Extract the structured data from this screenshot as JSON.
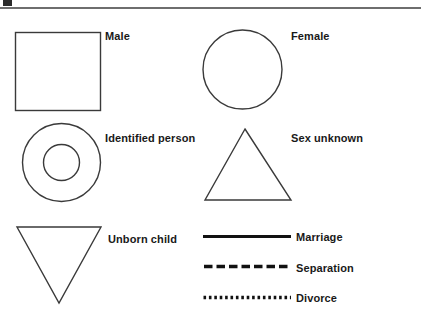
{
  "page": {
    "background_color": "#ffffff",
    "stroke_color": "#3a3a3a",
    "text_color": "#191919",
    "rule_color": "#6e6e6e"
  },
  "top_rule": {
    "present": true,
    "artifact_label": ""
  },
  "symbols": [
    {
      "id": "male",
      "label": "Male",
      "shape": "square",
      "icon": "square-symbol"
    },
    {
      "id": "female",
      "label": "Female",
      "shape": "circle",
      "icon": "circle-symbol"
    },
    {
      "id": "identified-person",
      "label": "Identified person",
      "shape": "double-circle",
      "icon": "double-circle-symbol"
    },
    {
      "id": "sex-unknown",
      "label": "Sex unknown",
      "shape": "triangle-up",
      "icon": "triangle-up-symbol"
    },
    {
      "id": "unborn-child",
      "label": "Unborn child",
      "shape": "triangle-down",
      "icon": "triangle-down-symbol"
    }
  ],
  "relationship_lines": [
    {
      "id": "marriage",
      "label": "Marriage",
      "style": "solid",
      "icon": "solid-line-symbol"
    },
    {
      "id": "separation",
      "label": "Separation",
      "style": "dashed",
      "icon": "dashed-line-symbol"
    },
    {
      "id": "divorce",
      "label": "Divorce",
      "style": "dotted",
      "icon": "dotted-line-symbol"
    }
  ]
}
